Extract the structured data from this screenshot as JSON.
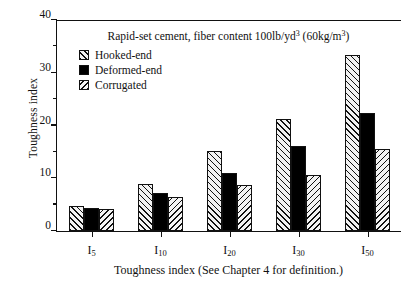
{
  "chart_data": {
    "type": "bar",
    "title": "Rapid-set cement, fiber content 100lb/yd3  (60kg/m3)",
    "title_parts": {
      "a": "Rapid-set cement, fiber content 100lb/yd",
      "sup1": "3",
      "b": "  (60kg/m",
      "sup2": "3",
      "c": ")"
    },
    "xlabel": "Toughness index (See Chapter 4 for definition.)",
    "ylabel": "Toughness index",
    "categories": [
      "I5",
      "I10",
      "I20",
      "I30",
      "I50"
    ],
    "category_labels": [
      {
        "base": "I",
        "sub": "5"
      },
      {
        "base": "I",
        "sub": "10"
      },
      {
        "base": "I",
        "sub": "20"
      },
      {
        "base": "I",
        "sub": "30"
      },
      {
        "base": "I",
        "sub": "50"
      }
    ],
    "series": [
      {
        "name": "Hooked-end",
        "pattern": "hatch-forward",
        "values": [
          4.7,
          9.0,
          15.2,
          21.2,
          33.4
        ]
      },
      {
        "name": "Deformed-end",
        "pattern": "solid-black",
        "values": [
          4.4,
          7.3,
          11.0,
          16.2,
          22.3
        ]
      },
      {
        "name": "Corrugated",
        "pattern": "hatch-backward",
        "values": [
          4.1,
          6.4,
          8.7,
          10.6,
          15.6
        ]
      }
    ],
    "ylim": [
      0,
      40
    ],
    "yticks": [
      0,
      10,
      20,
      30,
      40
    ],
    "ytick_labels": [
      "0",
      "10",
      "20",
      "30",
      "40"
    ],
    "yminor_ticks": [
      5,
      15,
      25,
      35
    ],
    "grid": false,
    "legend_position": "upper-left-inside",
    "colors": {
      "axis": "#111111",
      "solid_series": "#000000",
      "hatch_line": "#111111",
      "hatch_background": "#f2f2f2"
    }
  }
}
